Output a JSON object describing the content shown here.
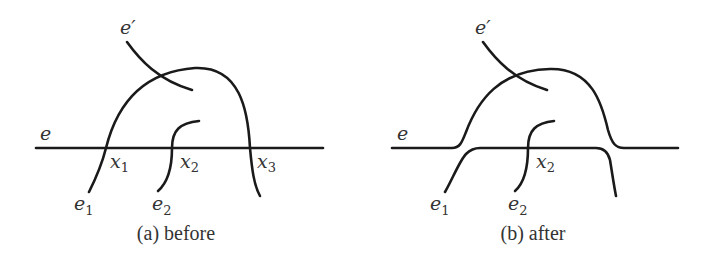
{
  "panels": [
    {
      "id": "before",
      "caption": "(a) before",
      "labels": {
        "e": "e",
        "e_prime": "e′",
        "e1": "e",
        "e1_sub": "1",
        "e2": "e",
        "e2_sub": "2",
        "x1": "x",
        "x1_sub": "1",
        "x2": "x",
        "x2_sub": "2",
        "x3": "x",
        "x3_sub": "3"
      }
    },
    {
      "id": "after",
      "caption": "(b) after",
      "labels": {
        "e": "e",
        "e_prime": "e′",
        "e1": "e",
        "e1_sub": "1",
        "e2": "e",
        "e2_sub": "2",
        "x2": "x",
        "x2_sub": "2"
      }
    }
  ],
  "colors": {
    "stroke": "#1a1a1a",
    "text": "#333333",
    "background": "#ffffff"
  }
}
